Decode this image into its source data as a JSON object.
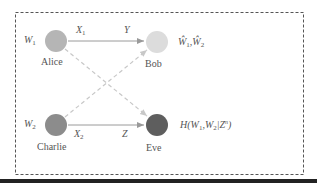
{
  "diagram": {
    "nodes": [
      {
        "id": "alice",
        "label": "Alice",
        "color": "#b5b5b5",
        "key": "W",
        "key_sub": "1"
      },
      {
        "id": "bob",
        "label": "Bob",
        "color": "#dcdcdc",
        "estimate": "Ŵ₁,Ŵ₂"
      },
      {
        "id": "charlie",
        "label": "Charlie",
        "color": "#8c8c8c",
        "key": "W",
        "key_sub": "2"
      },
      {
        "id": "eve",
        "label": "Eve",
        "color": "#5e5e5e",
        "equivocation": "H(W₁,W₂|Zⁿ)"
      }
    ],
    "edges": [
      {
        "from": "alice",
        "to": "bob",
        "style": "solid",
        "label_start": "X",
        "label_start_sub": "1",
        "label_end": "Y"
      },
      {
        "from": "charlie",
        "to": "eve",
        "style": "solid",
        "label_start": "X",
        "label_start_sub": "2",
        "label_end": "Z"
      },
      {
        "from": "alice",
        "to": "eve",
        "style": "dashed"
      },
      {
        "from": "charlie",
        "to": "bob",
        "style": "dashed"
      }
    ],
    "labels": {
      "w1": "W",
      "w1_sub": "1",
      "w2": "W",
      "w2_sub": "2",
      "x1": "X",
      "x1_sub": "1",
      "x2": "X",
      "x2_sub": "2",
      "y": "Y",
      "z": "Z",
      "alice": "Alice",
      "bob": "Bob",
      "charlie": "Charlie",
      "eve": "Eve",
      "bob_est_a": "Ŵ",
      "bob_est_a_sub": "1",
      "bob_est_sep": ",",
      "bob_est_b": "Ŵ",
      "bob_est_b_sub": "2",
      "eve_H": "H(W",
      "eve_H_sub1": "1",
      "eve_H_mid": ",W",
      "eve_H_sub2": "2",
      "eve_H_bar": "|Z",
      "eve_H_sup": "n",
      "eve_H_close": ")"
    },
    "colors": {
      "box_border": "#555555",
      "solid_edge": "#9a9a9a",
      "dashed_edge": "#c8c8c8",
      "bottom_bar": "#222222"
    }
  }
}
